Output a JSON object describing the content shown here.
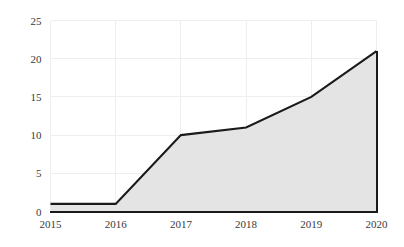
{
  "chart_data": {
    "type": "area",
    "title": "",
    "subtitle": "",
    "xlabel": "",
    "ylabel": "",
    "categories": [
      "2015",
      "2016",
      "2017",
      "2018",
      "2019",
      "2020"
    ],
    "x": [
      2015,
      2016,
      2017,
      2018,
      2019,
      2020
    ],
    "values": [
      1,
      1,
      10,
      11,
      15,
      21
    ],
    "series": [
      {
        "name": "",
        "values": [
          1,
          1,
          10,
          11,
          15,
          21
        ]
      }
    ],
    "xlim": [
      2015,
      2020
    ],
    "ylim": [
      0,
      25
    ],
    "ytick_labels": [
      "0",
      "5",
      "10",
      "15",
      "20",
      "25"
    ],
    "yticks": [
      0,
      5,
      10,
      15,
      20,
      25
    ],
    "xtick_labels": [
      "2015",
      "2016",
      "2017",
      "2018",
      "2019",
      "2020"
    ],
    "grid": true,
    "grid_axis": "both",
    "legend": false,
    "legend_position": "none",
    "colors": {
      "area_fill": "#e4e4e4",
      "line": "#1a1a1a",
      "gridline": "#eceff1",
      "axis": "#1a1a1a",
      "tick_label": "#3a3a3a",
      "background": "#ffffff"
    }
  },
  "axes": {
    "y_labels": [
      {
        "value": 25,
        "label": "25"
      },
      {
        "value": 20,
        "label": "20"
      },
      {
        "value": 15,
        "label": "15"
      },
      {
        "value": 10,
        "label": "10"
      },
      {
        "value": 5,
        "label": "5"
      },
      {
        "value": 0,
        "label": "0"
      }
    ],
    "x_labels": [
      {
        "value": 2015,
        "label": "2015"
      },
      {
        "value": 2016,
        "label": "2016"
      },
      {
        "value": 2017,
        "label": "2017"
      },
      {
        "value": 2018,
        "label": "2018"
      },
      {
        "value": 2019,
        "label": "2019"
      },
      {
        "value": 2020,
        "label": "2020"
      }
    ]
  }
}
